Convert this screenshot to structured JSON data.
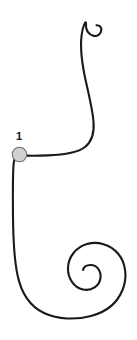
{
  "figure": {
    "background_color": "#ffffff",
    "stroke_color": "#1a1a1a",
    "stroke_width": 2.1,
    "width": 137,
    "height": 340
  },
  "curve": {
    "name": "s-scroll-curve",
    "description": "Single continuous line: small hook spiral at top right, long descent, leftward bend to marker, vertical descent on left, large inward spiral at bottom right",
    "path": "M 96.5 25.2 C 99.6 25.0 101.6 27.3 101.3 30.3 C 100.9 34.1 97.4 36.6 93.7 35.9 C 88.6 34.9 85.6 30.0 86.0 24.9 C 86.5 18.1 82.6 26.0 81.5 36.0 C 80.0 49.0 82.4 66.0 86.0 82.0 C 89.4 97.2 92.6 110.0 93.5 121.5 C 94.4 132.5 92.0 141.5 85.0 147.0 C 77.5 152.9 64.0 154.8 48.0 155.4 C 37.0 155.8 28.0 155.8 21.5 155.4 C 16.0 155.1 14.2 157.5 13.6 164.0 C 12.6 175.0 12.8 196.0 13.0 216.0 C 13.2 239.0 13.9 258.0 17.5 275.0 C 21.5 294.0 30.0 306.5 44.0 313.0 C 58.0 319.5 76.0 320.0 91.0 316.0 C 106.5 311.9 117.5 302.5 122.5 290.0 C 127.6 277.2 126.0 263.0 118.0 253.5 C 110.2 244.2 97.5 241.0 87.0 244.0 C 76.4 247.0 68.5 256.5 68.0 267.5 C 67.5 278.3 74.0 287.5 83.0 289.5 C 91.6 291.4 99.5 286.0 100.5 278.0 C 101.4 270.8 96.5 264.8 90.5 265.0 C 86.4 265.1 83.6 267.3 83.0 270.0"
  },
  "marker": {
    "name": "control-point-1",
    "label": "1",
    "cx": 19.5,
    "cy": 154.5,
    "r": 7.2,
    "fill_color": "#d2d2d2",
    "stroke_color": "#6e6e6e",
    "label_x": 19,
    "label_y": 140,
    "label_color": "#111111"
  }
}
